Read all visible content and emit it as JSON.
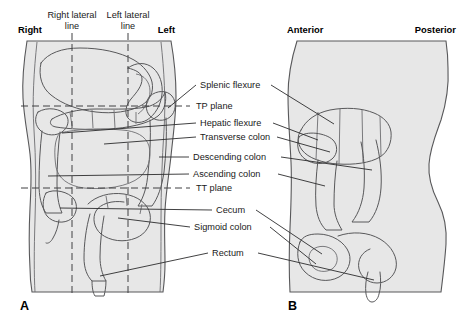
{
  "figure": {
    "background_color": "#ffffff",
    "body_fill_color": "#e7e7e7",
    "outline_color": "#58585a"
  },
  "panels": [
    {
      "id": "A",
      "letter": "A",
      "view": "anterior"
    },
    {
      "id": "B",
      "letter": "B",
      "view": "lateral"
    }
  ],
  "orientation_labels": {
    "right": "Right",
    "left": "Left",
    "anterior": "Anterior",
    "posterior": "Posterior"
  },
  "reference_lines": [
    {
      "id": "right-lateral-line",
      "line1": "Right lateral",
      "line2": "line",
      "type": "vertical"
    },
    {
      "id": "left-lateral-line",
      "line1": "Left lateral",
      "line2": "line",
      "type": "vertical"
    }
  ],
  "planes": [
    {
      "id": "tp-plane",
      "label": "TP plane"
    },
    {
      "id": "tt-plane",
      "label": "TT plane"
    }
  ],
  "structure_labels": [
    {
      "id": "splenic-flexure",
      "label": "Splenic flexure"
    },
    {
      "id": "hepatic-flexure",
      "label": "Hepatic flexure"
    },
    {
      "id": "transverse-colon",
      "label": "Transverse colon"
    },
    {
      "id": "descending-colon",
      "label": "Descending colon"
    },
    {
      "id": "ascending-colon",
      "label": "Ascending colon"
    },
    {
      "id": "cecum",
      "label": "Cecum"
    },
    {
      "id": "sigmoid-colon",
      "label": "Sigmoid colon"
    },
    {
      "id": "rectum",
      "label": "Rectum"
    }
  ]
}
